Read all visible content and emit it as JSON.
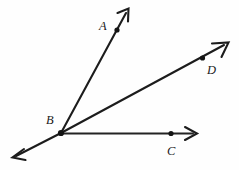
{
  "figure": {
    "type": "geometry-diagram",
    "background_color": "#fefefe",
    "stroke_color": "#1c1c1c",
    "label_color": "#1a1a1a",
    "vertex": {
      "name": "B",
      "label": "B",
      "x": 61,
      "y": 133,
      "label_x": 46,
      "label_y": 114
    },
    "points": [
      {
        "name": "A",
        "label": "A",
        "x": 117,
        "y": 30,
        "label_x": 99,
        "label_y": 20
      },
      {
        "name": "C",
        "label": "C",
        "x": 171,
        "y": 134,
        "label_x": 167,
        "label_y": 145
      },
      {
        "name": "D",
        "label": "D",
        "x": 202,
        "y": 58,
        "label_x": 207,
        "label_y": 64
      }
    ],
    "rays": [
      {
        "name": "ray-BA",
        "from": "B",
        "through": "A",
        "start_x": 61,
        "start_y": 133,
        "end_x": 128,
        "end_y": 10,
        "arrow": "end"
      },
      {
        "name": "ray-BD",
        "from": "B",
        "through": "D",
        "start_x": 61,
        "start_y": 133,
        "end_x": 228,
        "end_y": 43,
        "arrow": "end"
      },
      {
        "name": "ray-BC",
        "from": "B",
        "through": "C",
        "start_x": 61,
        "start_y": 133,
        "end_x": 197,
        "end_y": 134,
        "arrow": "end"
      },
      {
        "name": "ray-B-lower-left",
        "from": "B",
        "through": "",
        "start_x": 61,
        "start_y": 133,
        "end_x": 13,
        "end_y": 158,
        "arrow": "end"
      }
    ]
  }
}
